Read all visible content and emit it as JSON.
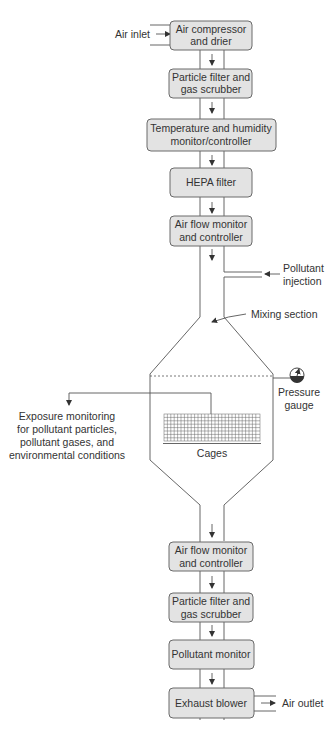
{
  "diagram": {
    "upstream_boxes": [
      {
        "id": "air-compressor",
        "lines": [
          "Air compressor",
          "and drier"
        ]
      },
      {
        "id": "particle-filter-1",
        "lines": [
          "Particle filter and",
          "gas scrubber"
        ]
      },
      {
        "id": "temp-humidity",
        "lines": [
          "Temperature and humidity",
          "monitor/controller"
        ]
      },
      {
        "id": "hepa-filter",
        "lines": [
          "HEPA filter"
        ]
      },
      {
        "id": "air-flow-1",
        "lines": [
          "Air flow monitor",
          "and controller"
        ]
      }
    ],
    "downstream_boxes": [
      {
        "id": "air-flow-2",
        "lines": [
          "Air flow monitor",
          "and controller"
        ]
      },
      {
        "id": "particle-filter-2",
        "lines": [
          "Particle filter and",
          "gas scrubber"
        ]
      },
      {
        "id": "pollutant-monitor",
        "lines": [
          "Pollutant monitor"
        ]
      },
      {
        "id": "exhaust-blower",
        "lines": [
          "Exhaust blower"
        ]
      }
    ],
    "labels": {
      "air_inlet": "Air inlet",
      "pollutant_injection": [
        "Pollutant",
        "injection"
      ],
      "mixing_section": "Mixing section",
      "pressure_gauge": [
        "Pressure",
        "gauge"
      ],
      "exposure_monitoring": [
        "Exposure monitoring",
        "for pollutant particles,",
        "pollutant gases, and",
        "environmental conditions"
      ],
      "cages": "Cages",
      "air_outlet": "Air outlet"
    },
    "colors": {
      "box_fill": "#e3e3e3",
      "box_stroke": "#6a6a6a",
      "line": "#555555",
      "text": "#333333"
    }
  }
}
